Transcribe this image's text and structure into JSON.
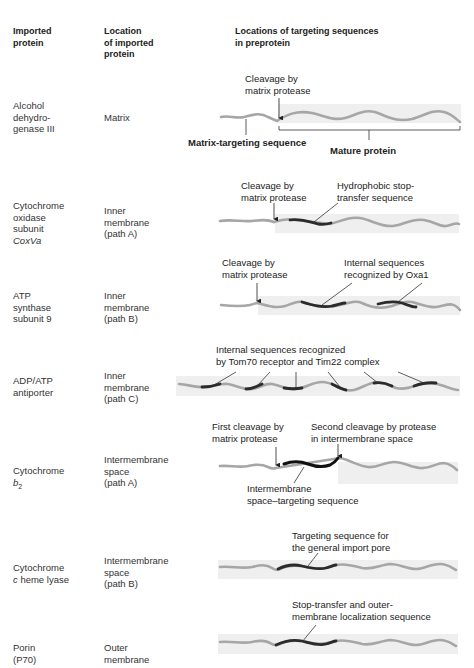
{
  "headers": {
    "protein": "Imported\nprotein",
    "location": "Location\nof imported\nprotein",
    "sequences": "Locations of targeting sequences\nin preprotein"
  },
  "rows": [
    {
      "protein": "Alcohol\ndehydro-\ngenase III",
      "location": "Matrix",
      "labels": {
        "cleavage": "Cleavage by\nmatrix protease",
        "targeting": "Matrix-targeting sequence",
        "mature": "Mature protein"
      }
    },
    {
      "protein_lines": [
        "Cytochrome",
        "oxidase",
        "subunit"
      ],
      "protein_italic": "CoxVa",
      "location": "Inner\nmembrane\n(path A)",
      "labels": {
        "cleavage": "Cleavage by\nmatrix protease",
        "stop_transfer": "Hydrophobic stop-\ntransfer sequence"
      }
    },
    {
      "protein": "ATP\nsynthase\nsubunit 9",
      "location": "Inner\nmembrane\n(path B)",
      "labels": {
        "cleavage": "Cleavage by\nmatrix protease",
        "internal": "Internal sequences\nrecognized by Oxa1"
      }
    },
    {
      "protein": "ADP/ATP\nantiporter",
      "location": "Inner\nmembrane\n(path C)",
      "labels": {
        "internal": "Internal sequences recognized\nby Tom70 receptor and Tim22 complex"
      }
    },
    {
      "protein_line": "Cytochrome",
      "protein_italic": "b",
      "protein_sub": "2",
      "location": "Intermembrane\nspace\n(path A)",
      "labels": {
        "first_cleavage": "First cleavage by\nmatrix protease",
        "second_cleavage": "Second cleavage by protease\nin intermembrane space",
        "ims_targeting": "Intermembrane\nspace–targeting sequence"
      }
    },
    {
      "protein_line": "Cytochrome",
      "protein_italic": "c",
      "protein_rest": " heme lyase",
      "location": "Intermembrane\nspace\n(path B)",
      "labels": {
        "targeting": "Targeting sequence for\nthe general import pore"
      }
    },
    {
      "protein": "Porin\n(P70)",
      "location": "Outer\nmembrane",
      "labels": {
        "stop_transfer": "Stop-transfer and outer-\nmembrane localization sequence"
      }
    }
  ],
  "colors": {
    "wave_light": "#a6a6a6",
    "wave_dark": "#2b2b2b",
    "mature_band": "#efefef",
    "text": "#222222"
  }
}
